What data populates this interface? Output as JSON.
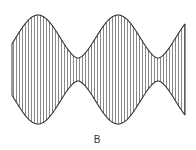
{
  "figure": {
    "type": "amplitude-modulated waveform",
    "label": "B",
    "line_color": "#333333",
    "hatch_color": "#555555",
    "background": "#ffffff"
  }
}
